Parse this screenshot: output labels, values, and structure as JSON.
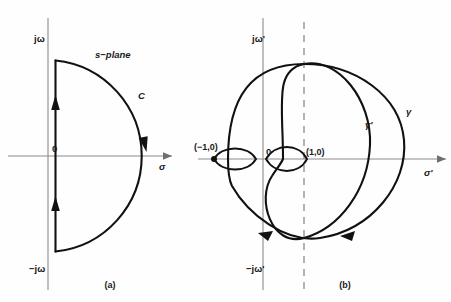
{
  "figure": {
    "type": "diagram",
    "background_color": "#fefefe",
    "curve_color": "#111111",
    "axis_color": "#8a8a8a"
  },
  "panel_a": {
    "caption": "(a)",
    "axis_vertical_top_label": "jω",
    "axis_vertical_bottom_label": "−jω",
    "axis_horizontal_label": "σ",
    "origin_label": "0",
    "plane_label": "s−plane",
    "contour_label": "C",
    "arrows": [
      {
        "name": "upper-imaginary-axis-arrow",
        "direction": "up"
      },
      {
        "name": "lower-imaginary-axis-arrow",
        "direction": "up"
      },
      {
        "name": "semicircle-arrow",
        "direction": "down"
      }
    ]
  },
  "panel_b": {
    "caption": "(b)",
    "axis_vertical_top_label": "jω'",
    "axis_vertical_bottom_label": "−jω'",
    "axis_horizontal_label": "σ'",
    "origin_label": "0",
    "point_minus_one_label": "(−1,0)",
    "point_one_label": "(1,0)",
    "curve_outer_label": "γ",
    "curve_inner_label": "γ'",
    "dashed_vertical_line": "x = 1",
    "arrows": [
      {
        "name": "gamma-prime-lower-left-arrow",
        "direction": "left"
      },
      {
        "name": "gamma-lower-right-arrow",
        "direction": "left"
      }
    ]
  }
}
